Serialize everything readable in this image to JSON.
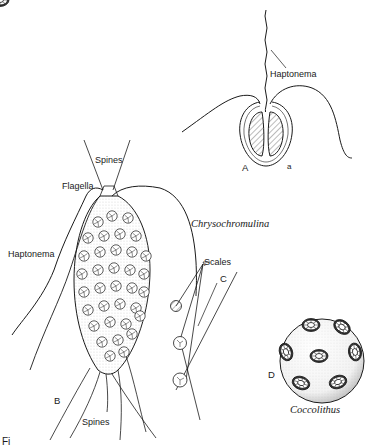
{
  "figure": {
    "caption_fragment": "Fi",
    "panels": {
      "A": {
        "letter": "A",
        "sublabel": "a",
        "labels": {
          "haptonema": "Haptonema"
        }
      },
      "B": {
        "letter": "B",
        "labels": {
          "spines_top": "Spines",
          "flagella": "Flagella",
          "haptonema": "Haptonema",
          "spines_bottom": "Spines"
        },
        "genus": "Chrysochromulina"
      },
      "C": {
        "letter": "C",
        "labels": {
          "scales": "Scales"
        }
      },
      "D": {
        "letter": "D",
        "genus": "Coccolithus"
      }
    },
    "colors": {
      "ink": "#1a1a1a",
      "background": "#ffffff",
      "hatch": "#555555"
    }
  }
}
